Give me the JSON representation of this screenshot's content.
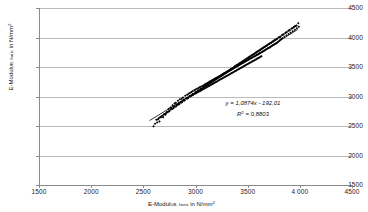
{
  "chart_data": {
    "type": "scatter",
    "title": "",
    "xlabel": "E-Modul (UB, horiz) in N/mm²",
    "ylabel": "E-Modul (UB, horiz) in N/mm²",
    "xlabel_main": "E-Modul",
    "xlabel_sub": "UB, horiz",
    "xlabel_tail": " in N/mm",
    "xlabel_sup": "2",
    "ylabel_main": "E-Modul",
    "ylabel_sub": "UB, horiz",
    "ylabel_tail": " in N/mm",
    "ylabel_sup": "2",
    "xlim": [
      1500,
      4500
    ],
    "ylim": [
      1500,
      4500
    ],
    "xticks": [
      1500,
      2000,
      2500,
      3000,
      3500,
      4000,
      4500
    ],
    "yticks": [
      1500,
      2000,
      2500,
      3000,
      3500,
      4000,
      4500
    ],
    "xtick_labels": [
      "1500",
      "2000",
      "2500",
      "3000",
      "3500",
      "4 000",
      "4500"
    ],
    "ytick_labels": [
      "1500",
      "2000",
      "2500",
      "3000",
      "3500",
      "4000",
      "4500"
    ],
    "grid": "horizontal",
    "legend": "none",
    "marker": "filled-diamond",
    "marker_color": "#000000",
    "annotation_equation": "y = 1,0874x - 192,01",
    "annotation_r2": "R² = 0,8803",
    "annotation_r2_base": "R",
    "annotation_r2_sup": "2",
    "annotation_r2_tail": " = 0,8803",
    "trendline": {
      "slope": 1.0874,
      "intercept": -192.01,
      "r_squared": 0.8803,
      "x_start": 2560,
      "x_end": 3980
    },
    "x": [
      2612,
      2598,
      2640,
      2668,
      2655,
      2700,
      2632,
      2690,
      2724,
      2742,
      2760,
      2712,
      2780,
      2748,
      2800,
      2770,
      2812,
      2832,
      2795,
      2850,
      2820,
      2868,
      2840,
      2880,
      2860,
      2902,
      2875,
      2920,
      2890,
      2935,
      2910,
      2948,
      2925,
      2962,
      2940,
      2975,
      2955,
      2990,
      2968,
      3002,
      2980,
      3015,
      2995,
      3028,
      3008,
      3040,
      3020,
      3052,
      3032,
      3065,
      3045,
      3075,
      3055,
      3088,
      3068,
      3098,
      3078,
      3110,
      3090,
      3120,
      3100,
      3132,
      3112,
      3142,
      3122,
      3152,
      3132,
      3162,
      3142,
      3172,
      3152,
      3182,
      3162,
      3192,
      3172,
      3202,
      3182,
      3212,
      3192,
      3222,
      3202,
      3232,
      3212,
      3242,
      3222,
      3252,
      3232,
      3262,
      3242,
      3272,
      3252,
      3282,
      3262,
      3292,
      3272,
      3302,
      3282,
      3312,
      3292,
      3322,
      3302,
      3332,
      3312,
      3342,
      3322,
      3352,
      3332,
      3362,
      3342,
      3372,
      3352,
      3382,
      3362,
      3392,
      3372,
      3402,
      3382,
      3412,
      3392,
      3422,
      3402,
      3432,
      3412,
      3442,
      3422,
      3452,
      3432,
      3462,
      3442,
      3472,
      3452,
      3482,
      3462,
      3492,
      3472,
      3502,
      3482,
      3512,
      3492,
      3522,
      3502,
      3532,
      3512,
      3542,
      3522,
      3552,
      3532,
      3562,
      3542,
      3572,
      3552,
      3582,
      3562,
      3592,
      3572,
      3602,
      3582,
      3612,
      3592,
      3622,
      3602,
      3632,
      3612,
      3642,
      3622,
      3652,
      3632,
      3662,
      3672,
      3682,
      3692,
      3702,
      3712,
      3722,
      3732,
      3742,
      3752,
      3762,
      3772,
      3782,
      3792,
      3802,
      3812,
      3822,
      3832,
      3852,
      3872,
      3892,
      3912,
      3932,
      3952,
      3972,
      3990,
      2625,
      2660,
      2695,
      2730,
      2765,
      2790,
      2825,
      2855,
      2885,
      2915,
      2945,
      2970,
      3000,
      3025,
      3050,
      3075,
      3095,
      3115,
      3135,
      3155,
      3175,
      3195,
      3215,
      3235,
      3255,
      3275,
      3295,
      3315,
      3335,
      3355,
      3375,
      3395,
      3415,
      3435,
      3455,
      3475,
      3495,
      3515,
      3535,
      3555,
      3575,
      3595,
      3615,
      3635,
      3655,
      3675,
      3695,
      3715,
      3735,
      3755,
      3775,
      3800,
      3830,
      3860,
      3890,
      3920,
      3950,
      2648,
      2682,
      2718,
      2752,
      2788,
      2815,
      2845,
      2872,
      2898,
      2928,
      2955,
      2982,
      3010,
      3035,
      3060,
      3085,
      3105,
      3125,
      3145,
      3165,
      3185,
      3205,
      3225,
      3245,
      3265,
      3285,
      3305,
      3325,
      3345,
      3365,
      3385,
      3405,
      3425,
      3445,
      3465,
      3485,
      3505,
      3525,
      3545,
      3565,
      3585,
      3605,
      3625,
      3645,
      3665,
      3685,
      3705,
      3725,
      3745,
      3765,
      3785,
      3815,
      3845,
      3875,
      3905,
      3940,
      3968,
      2672,
      2708,
      2738,
      2775,
      2805,
      2838,
      2865,
      2892,
      2922,
      2950,
      2978,
      3005,
      3030,
      3055,
      3080,
      3102,
      3122,
      3142,
      3162,
      3182,
      3202,
      3222,
      3242,
      3262,
      3282,
      3302,
      3322,
      3342,
      3362,
      3382,
      3402,
      3422,
      3442,
      3462,
      3482,
      3502,
      3522,
      3542,
      3562,
      3582,
      3602,
      3622,
      3642,
      3662,
      3682,
      3702,
      3722,
      3742,
      3762,
      3782,
      3808,
      3838,
      3868,
      3898,
      3928,
      3958,
      3985
    ],
    "y": [
      2540,
      2495,
      2612,
      2648,
      2575,
      2702,
      2560,
      2648,
      2735,
      2790,
      2812,
      2690,
      2852,
      2748,
      2880,
      2800,
      2892,
      2928,
      2838,
      2952,
      2862,
      2962,
      2885,
      2985,
      2908,
      3012,
      2925,
      3028,
      2948,
      3048,
      2965,
      3062,
      2980,
      3078,
      2998,
      3092,
      3012,
      3108,
      3022,
      3118,
      3032,
      3132,
      3048,
      3142,
      3060,
      3155,
      3072,
      3165,
      3082,
      3178,
      3095,
      3188,
      3105,
      3202,
      3118,
      3212,
      3128,
      3225,
      3140,
      3235,
      3150,
      3248,
      3162,
      3258,
      3172,
      3268,
      3182,
      3278,
      3192,
      3288,
      3202,
      3298,
      3212,
      3308,
      3222,
      3318,
      3232,
      3328,
      3242,
      3338,
      3252,
      3348,
      3262,
      3358,
      3272,
      3368,
      3282,
      3378,
      3292,
      3388,
      3302,
      3398,
      3312,
      3408,
      3322,
      3418,
      3332,
      3428,
      3342,
      3438,
      3352,
      3448,
      3362,
      3458,
      3372,
      3468,
      3382,
      3478,
      3392,
      3488,
      3402,
      3498,
      3412,
      3508,
      3422,
      3518,
      3432,
      3528,
      3442,
      3538,
      3452,
      3548,
      3462,
      3558,
      3472,
      3568,
      3482,
      3578,
      3492,
      3588,
      3502,
      3598,
      3512,
      3608,
      3522,
      3618,
      3532,
      3628,
      3542,
      3638,
      3552,
      3648,
      3562,
      3658,
      3572,
      3668,
      3582,
      3678,
      3592,
      3688,
      3602,
      3698,
      3612,
      3708,
      3622,
      3718,
      3632,
      3728,
      3642,
      3738,
      3652,
      3748,
      3662,
      3758,
      3672,
      3768,
      3682,
      3778,
      3792,
      3802,
      3812,
      3822,
      3832,
      3845,
      3858,
      3868,
      3878,
      3888,
      3898,
      3912,
      3928,
      3942,
      3958,
      3972,
      3988,
      4008,
      4032,
      4058,
      4082,
      4108,
      4132,
      4158,
      4182,
      2605,
      2648,
      2692,
      2738,
      2785,
      2818,
      2862,
      2898,
      2935,
      2972,
      3008,
      3038,
      3072,
      3102,
      3132,
      3158,
      3182,
      3205,
      3228,
      3252,
      3275,
      3298,
      3322,
      3345,
      3368,
      3392,
      3415,
      3438,
      3462,
      3485,
      3508,
      3532,
      3555,
      3578,
      3602,
      3625,
      3648,
      3672,
      3695,
      3718,
      3742,
      3765,
      3788,
      3812,
      3835,
      3858,
      3882,
      3905,
      3928,
      3952,
      3975,
      4005,
      4042,
      4078,
      4115,
      4152,
      4188,
      2632,
      2672,
      2715,
      2758,
      2802,
      2835,
      2872,
      2905,
      2938,
      2975,
      3008,
      3042,
      3075,
      3105,
      3135,
      3165,
      3188,
      3212,
      3235,
      3258,
      3282,
      3305,
      3328,
      3352,
      3375,
      3398,
      3422,
      3445,
      3468,
      3492,
      3515,
      3538,
      3562,
      3585,
      3608,
      3632,
      3655,
      3678,
      3702,
      3725,
      3748,
      3772,
      3795,
      3818,
      3842,
      3865,
      3888,
      3912,
      3935,
      3958,
      3982,
      4018,
      4055,
      4092,
      4128,
      4172,
      4205,
      2662,
      2705,
      2742,
      2788,
      2825,
      2865,
      2898,
      2932,
      2968,
      3002,
      3035,
      3068,
      3098,
      3128,
      3158,
      3185,
      3208,
      3232,
      3255,
      3278,
      3302,
      3325,
      3348,
      3372,
      3395,
      3418,
      3442,
      3465,
      3488,
      3512,
      3535,
      3558,
      3582,
      3605,
      3628,
      3652,
      3675,
      3698,
      3722,
      3745,
      3768,
      3792,
      3815,
      3838,
      3862,
      3885,
      3908,
      3932,
      3955,
      3978,
      4010,
      4048,
      4085,
      4122,
      4158,
      4195,
      4240
    ]
  }
}
